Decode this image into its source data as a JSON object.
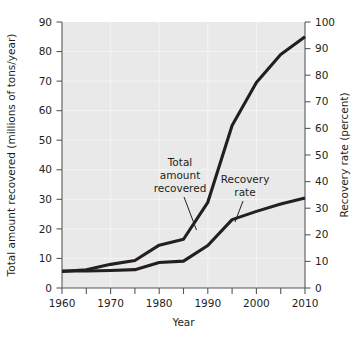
{
  "chart_data": {
    "type": "line",
    "title": "",
    "xlabel": "Year",
    "ylabel": "Total amount recovered (millions of tons/year)",
    "y2label": "Recovery rate (percent)",
    "xlim": [
      1960,
      2010
    ],
    "ylim": [
      0,
      90
    ],
    "y2lim": [
      0,
      100
    ],
    "grid": true,
    "legend": "none (inline annotations with leader lines)",
    "x_ticks": [
      1960,
      1970,
      1980,
      1990,
      2000,
      2010
    ],
    "x_minor_ticks": [
      1965,
      1975,
      1985,
      1995,
      2005
    ],
    "y_ticks": [
      0,
      10,
      20,
      30,
      40,
      50,
      60,
      70,
      80,
      90
    ],
    "y2_ticks": [
      0,
      10,
      20,
      30,
      40,
      50,
      60,
      70,
      80,
      90,
      100
    ],
    "series": [
      {
        "name": "Total amount recovered",
        "axis": "left",
        "units": "millions of tons/year",
        "x": [
          1960,
          1965,
          1970,
          1975,
          1980,
          1985,
          1990,
          1995,
          2000,
          2005,
          2010
        ],
        "values": [
          5.6,
          6.2,
          8.0,
          9.3,
          14.5,
          16.5,
          29.0,
          55.0,
          69.5,
          79.0,
          85.0
        ]
      },
      {
        "name": "Recovery rate",
        "axis": "right",
        "units": "percent",
        "x": [
          1960,
          1965,
          1970,
          1975,
          1980,
          1985,
          1990,
          1995,
          2000,
          2005,
          2010
        ],
        "values": [
          6.4,
          6.4,
          6.6,
          6.9,
          9.6,
          10.1,
          16.0,
          25.7,
          28.8,
          31.6,
          33.8
        ]
      }
    ],
    "annotations": [
      {
        "text": "Total amount recovered",
        "lines": [
          "Total",
          "amount",
          "recovered"
        ]
      },
      {
        "text": "Recovery rate",
        "lines": [
          "Recovery",
          "rate"
        ]
      }
    ],
    "colors": {
      "plot_background": "#e9e9e9",
      "series_line": "#231f20",
      "axis": "#58595b",
      "gridline": "#f4f4f4",
      "page_background": "#ffffff"
    }
  },
  "axes": {
    "left": {
      "title": "Total amount recovered (millions of tons/year)",
      "ticks": [
        "0",
        "10",
        "20",
        "30",
        "40",
        "50",
        "60",
        "70",
        "80",
        "90"
      ]
    },
    "right": {
      "title": "Recovery rate (percent)",
      "ticks": [
        "0",
        "10",
        "20",
        "30",
        "40",
        "50",
        "60",
        "70",
        "80",
        "90",
        "100"
      ]
    },
    "bottom": {
      "title": "Year",
      "ticks": [
        "1960",
        "1970",
        "1980",
        "1990",
        "2000",
        "2010"
      ]
    }
  },
  "annotations": {
    "total_amount": {
      "line1": "Total",
      "line2": "amount",
      "line3": "recovered"
    },
    "recovery_rate": {
      "line1": "Recovery",
      "line2": "rate"
    }
  }
}
